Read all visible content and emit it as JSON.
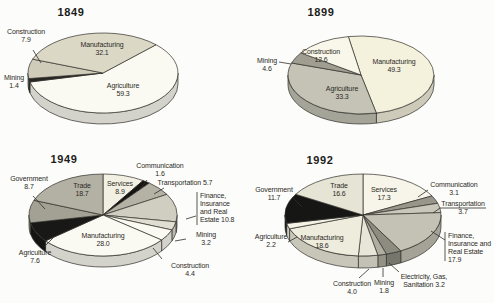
{
  "figure": {
    "width": 494,
    "height": 303,
    "background": "#fcfcfa",
    "stroke_color": "#2f2e29",
    "text_color": "#2b2a26"
  },
  "chart_data": [
    {
      "type": "pie",
      "title": "1849",
      "title_pos": {
        "x": 71,
        "y": 6
      },
      "pie": {
        "cx": 103,
        "cy": 73,
        "rx": 75,
        "ry": 40,
        "depth": 11,
        "start_angle": 45
      },
      "slices": [
        {
          "label": "Agriculture",
          "value": 59.3,
          "color": "#fbfaf2",
          "text": {
            "lines": [
              "Agriculture",
              "59.3"
            ],
            "x": 123,
            "y": 82,
            "align": "center"
          }
        },
        {
          "label": "Mining",
          "value": 1.4,
          "color": "#262622",
          "text": {
            "lines": [
              "Mining",
              "1.4"
            ],
            "x": 14,
            "y": 74,
            "align": "center"
          }
        },
        {
          "label": "Construction",
          "value": 7.9,
          "color": "#d0ccba",
          "text": {
            "lines": [
              "Construction",
              "7.9"
            ],
            "x": 26,
            "y": 28,
            "align": "center"
          },
          "leaders": [
            [
              [
                33,
                50
              ],
              [
                41,
                63
              ]
            ]
          ]
        },
        {
          "label": "Manufacturing",
          "value": 32.1,
          "color": "#dcd8c6",
          "text": {
            "lines": [
              "Manufacturing",
              "32.1"
            ],
            "x": 102,
            "y": 41,
            "align": "center"
          }
        }
      ]
    },
    {
      "type": "pie",
      "title": "1899",
      "title_pos": {
        "x": 321,
        "y": 6
      },
      "pie": {
        "cx": 361,
        "cy": 75,
        "rx": 73,
        "ry": 39,
        "depth": 10,
        "start_angle": -10
      },
      "slices": [
        {
          "label": "Manufacturing",
          "value": 49.3,
          "color": "#f4f1dd",
          "text": {
            "lines": [
              "Manufacturing",
              "49.3"
            ],
            "x": 394,
            "y": 58,
            "align": "center"
          }
        },
        {
          "label": "Agriculture",
          "value": 33.3,
          "color": "#c5c3b5",
          "text": {
            "lines": [
              "Agriculture",
              "33.3"
            ],
            "x": 342,
            "y": 85,
            "align": "center"
          }
        },
        {
          "label": "Mining",
          "value": 4.6,
          "color": "#a09e90",
          "text": {
            "lines": [
              "Mining",
              "4.6"
            ],
            "x": 267,
            "y": 57,
            "align": "center"
          },
          "leaders": [
            [
              [
                279,
                62
              ],
              [
                291,
                64
              ]
            ]
          ]
        },
        {
          "label": "Construction",
          "value": 12.6,
          "color": "#f9f7e9",
          "text": {
            "lines": [
              "Construction",
              "12.6"
            ],
            "x": 321,
            "y": 48,
            "align": "center"
          }
        }
      ]
    },
    {
      "type": "pie",
      "title": "1949",
      "title_pos": {
        "x": 64,
        "y": 153
      },
      "pie": {
        "cx": 103,
        "cy": 215,
        "rx": 74,
        "ry": 41,
        "depth": 11,
        "start_angle": 0
      },
      "slices": [
        {
          "label": "Services",
          "value": 8.9,
          "color": "#f2f0e2",
          "text": {
            "lines": [
              "Services",
              "8.9"
            ],
            "x": 120,
            "y": 180,
            "align": "center"
          }
        },
        {
          "label": "Communication",
          "value": 1.6,
          "color": "#151513",
          "text": {
            "lines": [
              "Communication",
              "1.6"
            ],
            "x": 160,
            "y": 162,
            "align": "center"
          },
          "leaders": [
            [
              [
                147,
                180
              ],
              [
                139,
                190
              ]
            ]
          ]
        },
        {
          "label": "Transportation",
          "value": 5.7,
          "color": "#b4b2a4",
          "text": {
            "lines": [
              "Transportation 5.7"
            ],
            "x": 185,
            "y": 179,
            "align": "center"
          },
          "leaders": [
            [
              [
                164,
                188
              ],
              [
                154,
                194
              ]
            ]
          ]
        },
        {
          "label": "Finance, Insurance and Real Estate",
          "value": 10.8,
          "color": "#d0cec0",
          "text": {
            "lines": [
              "Finance,",
              "Insurance",
              "and Real",
              "Estate 10.8"
            ],
            "x": 200,
            "y": 192,
            "align": "left"
          },
          "leaders": [
            [
              [
                197,
                192
              ],
              [
                197,
                225
              ]
            ],
            [
              [
                196,
                216
              ],
              [
                186,
                219
              ]
            ]
          ]
        },
        {
          "label": "Mining",
          "value": 3.2,
          "color": "#e0ded0",
          "text": {
            "lines": [
              "Mining",
              "3.2"
            ],
            "x": 206,
            "y": 231,
            "align": "center"
          },
          "leaders": [
            [
              [
                175,
                241
              ],
              [
                186,
                239
              ]
            ]
          ]
        },
        {
          "label": "Construction",
          "value": 4.4,
          "color": "#fbfaf2",
          "text": {
            "lines": [
              "Construction",
              "4.4"
            ],
            "x": 190,
            "y": 262,
            "align": "center"
          },
          "leaders": [
            [
              [
                153,
                248
              ],
              [
                162,
                259
              ]
            ]
          ]
        },
        {
          "label": "Manufacturing",
          "value": 28.0,
          "color": "#fbfaf2",
          "text": {
            "lines": [
              "Manufacturing",
              "28.0"
            ],
            "x": 103,
            "y": 232,
            "align": "center"
          }
        },
        {
          "label": "Agriculture",
          "value": 7.6,
          "color": "#181816",
          "text": {
            "lines": [
              "Agriculture",
              "7.6"
            ],
            "x": 35,
            "y": 249,
            "align": "center"
          },
          "leaders": [
            [
              [
                44,
                247
              ],
              [
                53,
                238
              ]
            ]
          ]
        },
        {
          "label": "Government",
          "value": 8.7,
          "color": "#a3a193",
          "text": {
            "lines": [
              "Government",
              "8.7"
            ],
            "x": 29,
            "y": 175,
            "align": "center"
          },
          "leaders": [
            [
              [
                33,
                196
              ],
              [
                45,
                209
              ]
            ]
          ]
        },
        {
          "label": "Trade",
          "value": 18.7,
          "color": "#b3b1a3",
          "text": {
            "lines": [
              "Trade",
              "18.7"
            ],
            "x": 82,
            "y": 182,
            "align": "center"
          }
        }
      ]
    },
    {
      "type": "pie",
      "title": "1992",
      "title_pos": {
        "x": 320,
        "y": 154
      },
      "pie": {
        "cx": 363,
        "cy": 215,
        "rx": 78,
        "ry": 41,
        "depth": 12,
        "start_angle": 0
      },
      "slices": [
        {
          "label": "Services",
          "value": 17.3,
          "color": "#f7f5e9",
          "text": {
            "lines": [
              "Services",
              "17.3"
            ],
            "x": 384,
            "y": 186,
            "align": "center"
          }
        },
        {
          "label": "Communication",
          "value": 3.1,
          "color": "#98968a",
          "text": {
            "lines": [
              "Communication",
              "3.1"
            ],
            "x": 454,
            "y": 181,
            "align": "center"
          },
          "leaders": [
            [
              [
                428,
                190
              ],
              [
                418,
                197
              ]
            ]
          ]
        },
        {
          "label": "Transportation",
          "value": 3.7,
          "color": "#c9c7b9",
          "text": {
            "lines": [
              "Transportation",
              "3.7"
            ],
            "x": 463,
            "y": 200,
            "align": "center"
          },
          "leaders": [
            [
              [
                433,
                213
              ],
              [
                440,
                208
              ],
              [
                486,
                208
              ]
            ]
          ]
        },
        {
          "label": "Finance, Insurance and Real Estate",
          "value": 17.9,
          "color": "#c4c2b4",
          "text": {
            "lines": [
              "Finance,",
              "Insurance and",
              "Real Estate",
              "17.9"
            ],
            "x": 448,
            "y": 232,
            "align": "left"
          },
          "leaders": [
            [
              [
                445,
                232
              ],
              [
                445,
                261
              ]
            ],
            [
              [
                445,
                240
              ],
              [
                431,
                231
              ]
            ]
          ]
        },
        {
          "label": "Electricity, Gas, Sanitation",
          "value": 3.2,
          "color": "#8e8c80",
          "text": {
            "lines": [
              "Electricity, Gas,",
              "Sanitation 3.2"
            ],
            "x": 424,
            "y": 273,
            "align": "center"
          },
          "leaders": [
            [
              [
                399,
                272
              ],
              [
                389,
                263
              ]
            ]
          ]
        },
        {
          "label": "Mining",
          "value": 1.8,
          "color": "#b0aea0",
          "text": {
            "lines": [
              "Mining",
              "1.8"
            ],
            "x": 384,
            "y": 279,
            "align": "center"
          },
          "leaders": [
            [
              [
                383,
                268
              ],
              [
                383,
                277
              ]
            ]
          ]
        },
        {
          "label": "Construction",
          "value": 4.0,
          "color": "#e8e6d8",
          "text": {
            "lines": [
              "Construction",
              "4.0"
            ],
            "x": 352,
            "y": 280,
            "align": "center"
          },
          "leaders": [
            [
              [
                359,
                278
              ],
              [
                369,
                269
              ]
            ]
          ]
        },
        {
          "label": "Manufacturing",
          "value": 18.6,
          "color": "#eeecdc",
          "text": {
            "lines": [
              "Manufacturing",
              "18.6"
            ],
            "x": 322,
            "y": 234,
            "align": "center"
          }
        },
        {
          "label": "Agriculture",
          "value": 2.2,
          "color": "#f5f3e5",
          "text": {
            "lines": [
              "Agriculture",
              "2.2"
            ],
            "x": 271,
            "y": 233,
            "align": "center"
          },
          "leaders": [
            [
              [
                288,
                242
              ],
              [
                297,
                237
              ]
            ]
          ]
        },
        {
          "label": "Government",
          "value": 11.7,
          "color": "#161614",
          "text": {
            "lines": [
              "Government",
              "11.7"
            ],
            "x": 274,
            "y": 186,
            "align": "center"
          },
          "leaders": [
            [
              [
                292,
                197
              ],
              [
                302,
                207
              ]
            ]
          ]
        },
        {
          "label": "Trade",
          "value": 16.6,
          "color": "#e6e4d4",
          "text": {
            "lines": [
              "Trade",
              "16.6"
            ],
            "x": 339,
            "y": 182,
            "align": "center"
          }
        }
      ]
    }
  ]
}
